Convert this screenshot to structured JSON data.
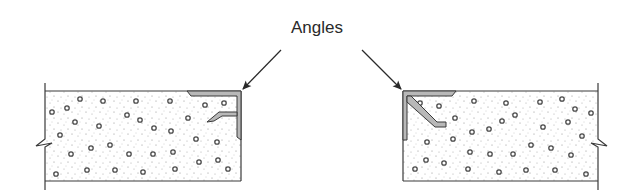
{
  "diagram": {
    "label": "Angles",
    "label_position": {
      "x": 318,
      "y": 28
    },
    "colors": {
      "line": "#3a3a3a",
      "angle_fill": "#b8b8b8",
      "concrete_fill": "#ffffff",
      "speckle": "#8a8a8a",
      "aggregate": "#4a4a4a"
    },
    "slabs": [
      {
        "name": "left-slab",
        "x": 45,
        "y": 91,
        "width": 196,
        "height": 90,
        "broken_side": "left",
        "angle_corner": "top-right"
      },
      {
        "name": "right-slab",
        "x": 403,
        "y": 91,
        "width": 195,
        "height": 90,
        "broken_side": "right",
        "angle_corner": "top-left"
      }
    ],
    "arrows": [
      {
        "name": "left-arrow",
        "from": [
          281,
          50
        ],
        "to": [
          243,
          90
        ]
      },
      {
        "name": "right-arrow",
        "from": [
          362,
          50
        ],
        "to": [
          402,
          90
        ]
      }
    ]
  }
}
